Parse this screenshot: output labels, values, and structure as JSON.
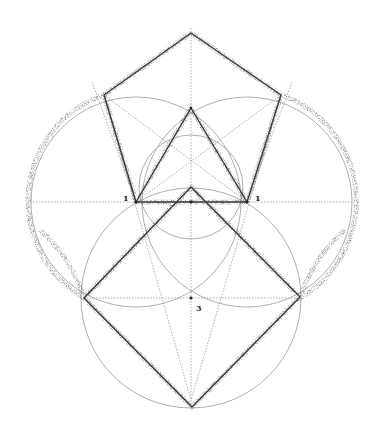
{
  "diagram": {
    "type": "geometric-construction",
    "labels": [
      {
        "id": "p1-left",
        "text": "1",
        "x": 125,
        "y": 201
      },
      {
        "id": "p1-right",
        "text": "1",
        "x": 255,
        "y": 201
      },
      {
        "id": "p3",
        "text": "3",
        "x": 197,
        "y": 311
      }
    ],
    "colors": {
      "construction": "#9a9a9a",
      "outline": "#3a3a3a",
      "stipple": "#777777"
    }
  }
}
